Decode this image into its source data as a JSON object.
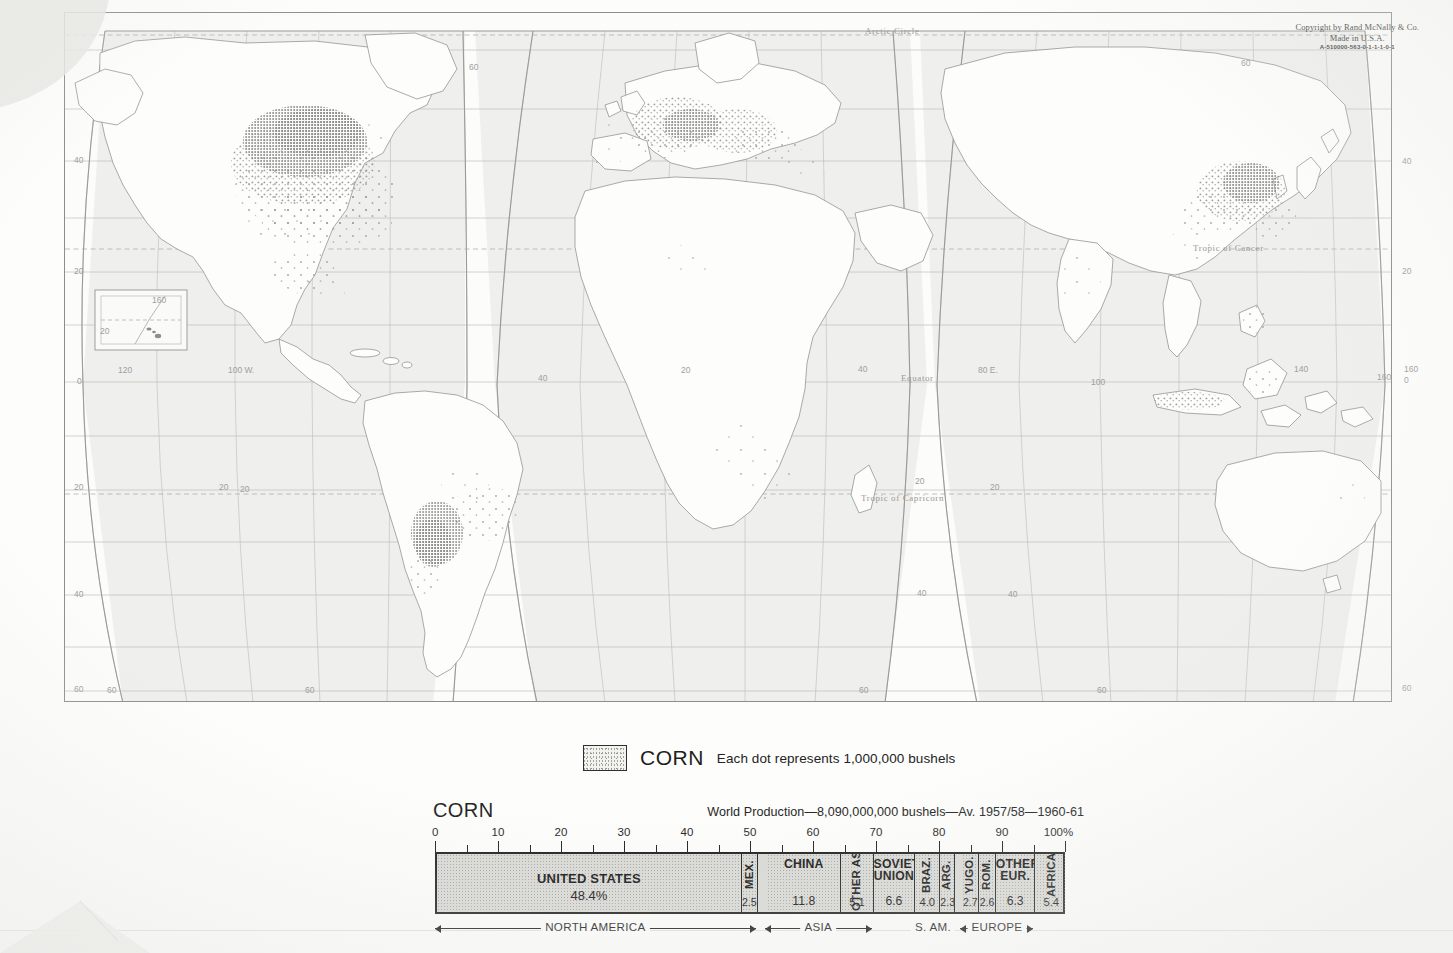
{
  "page": {
    "publisher_copyright": {
      "line1": "Copyright by Rand McNally & Co.",
      "line2": "Made in U.S.A.",
      "code": "A-510000-563-0-1-1-1-0-1"
    }
  },
  "legend": {
    "swatch_name": "corn-dot-pattern-swatch",
    "title": "CORN",
    "note": "Each dot represents 1,000,000 bushels"
  },
  "map": {
    "reference_lines": [
      {
        "label": "Arctic Circle",
        "x": 866,
        "y": 30
      },
      {
        "label": "Tropic of Cancer",
        "x": 1196,
        "y": 241
      },
      {
        "label": "Tropic of Capricorn",
        "x": 862,
        "y": 491
      },
      {
        "label": "Equator",
        "x": 900,
        "y": 369
      }
    ],
    "longitude_labels": [
      {
        "label": "120",
        "x": 124,
        "y": 371
      },
      {
        "label": "100 W.",
        "x": 233,
        "y": 371
      },
      {
        "label": "40",
        "x": 541,
        "y": 378
      },
      {
        "label": "20",
        "x": 684,
        "y": 371
      },
      {
        "label": "40",
        "x": 862,
        "y": 369
      },
      {
        "label": "80 E.",
        "x": 982,
        "y": 371
      },
      {
        "label": "100",
        "x": 1095,
        "y": 382
      },
      {
        "label": "140",
        "x": 1298,
        "y": 369
      },
      {
        "label": "160",
        "x": 1409,
        "y": 369
      }
    ],
    "latitude_labels_left": [
      {
        "label": "40",
        "x": 78,
        "y": 160
      },
      {
        "label": "20",
        "x": 78,
        "y": 271
      },
      {
        "label": "0",
        "x": 80,
        "y": 381
      },
      {
        "label": "20",
        "x": 78,
        "y": 487
      },
      {
        "label": "40",
        "x": 78,
        "y": 594
      },
      {
        "label": "60",
        "x": 78,
        "y": 689
      }
    ],
    "latitude_labels_right": [
      {
        "label": "40",
        "x": 1405,
        "y": 161
      },
      {
        "label": "20",
        "x": 1405,
        "y": 271
      },
      {
        "label": "0",
        "x": 1407,
        "y": 380
      },
      {
        "label": "60",
        "x": 1405,
        "y": 688
      }
    ],
    "other_grid_labels": [
      {
        "label": "60",
        "x": 472,
        "y": 67
      },
      {
        "label": "60",
        "x": 1244,
        "y": 63
      },
      {
        "label": "20",
        "x": 222,
        "y": 487
      },
      {
        "label": "20",
        "x": 243,
        "y": 489
      },
      {
        "label": "20",
        "x": 918,
        "y": 481
      },
      {
        "label": "20",
        "x": 993,
        "y": 487
      },
      {
        "label": "40",
        "x": 920,
        "y": 593
      },
      {
        "label": "40",
        "x": 1011,
        "y": 594
      },
      {
        "label": "60",
        "x": 110,
        "y": 690
      },
      {
        "label": "60",
        "x": 308,
        "y": 690
      },
      {
        "label": "60",
        "x": 862,
        "y": 690
      },
      {
        "label": "60",
        "x": 1100,
        "y": 690
      },
      {
        "label": "160",
        "x": 1381,
        "y": 377
      }
    ],
    "inset": {
      "name": "hawaii-inset",
      "labels": [
        {
          "label": "160",
          "x": 156,
          "y": 300
        },
        {
          "label": "20",
          "x": 103,
          "y": 331
        }
      ]
    }
  },
  "chart_data": {
    "type": "bar",
    "orientation": "stacked-horizontal-100pct",
    "title": "CORN",
    "subtitle": "World Production—8,090,000,000 bushels—Av. 1957/58—1960-61",
    "xlabel": "",
    "ylabel": "",
    "xlim": [
      0,
      100
    ],
    "axis_unit": "%",
    "axis_end_label": "100%",
    "tick_labels": [
      "0",
      "10",
      "20",
      "30",
      "40",
      "50",
      "60",
      "70",
      "80",
      "90",
      "100"
    ],
    "major_tick_step": 10,
    "minor_tick_step": 5,
    "grid": false,
    "legend": "none",
    "categories": [
      "UNITED STATES",
      "MEX.",
      "CHINA",
      "OTHER ASIA",
      "SOVIET UNION",
      "BRAZ.",
      "ARG.",
      "YUGO.",
      "ROM.",
      "OTHER EUR.",
      "AFRICA"
    ],
    "values": [
      48.4,
      2.5,
      11.8,
      5.1,
      6.6,
      4.0,
      2.3,
      2.7,
      2.6,
      6.3,
      5.4
    ],
    "value_labels": [
      "48.4%",
      "2.5",
      "11.8",
      "5.1",
      "6.6",
      "4.0",
      "2.3",
      "2.7",
      "2.6",
      "6.3",
      "5.4"
    ],
    "segments": [
      {
        "name": "UNITED STATES",
        "name_lines": [
          "UNITED STATES"
        ],
        "value": 48.4,
        "value_label": "48.4%",
        "start": 0.0,
        "end": 48.4,
        "orient": "h",
        "size": "big"
      },
      {
        "name": "MEX.",
        "name_lines": [
          "MEX."
        ],
        "value": 2.5,
        "value_label": "2.5",
        "start": 48.4,
        "end": 50.9,
        "orient": "v",
        "size": "narrow"
      },
      {
        "name": "CHINA",
        "name_lines": [
          "CHINA"
        ],
        "value": 11.8,
        "value_label": "11.8",
        "start": 52.4,
        "end": 64.2,
        "orient": "h",
        "size": "normal"
      },
      {
        "name": "OTHER ASIA",
        "name_lines": [
          "OTHER",
          "ASIA"
        ],
        "value": 5.1,
        "value_label": "5.1",
        "start": 64.2,
        "end": 69.3,
        "orient": "v",
        "size": "normal"
      },
      {
        "name": "SOVIET UNION",
        "name_lines": [
          "SOVIET",
          "UNION"
        ],
        "value": 6.6,
        "value_label": "6.6",
        "start": 69.3,
        "end": 75.9,
        "orient": "h",
        "size": "normal"
      },
      {
        "name": "BRAZ.",
        "name_lines": [
          "BRAZ."
        ],
        "value": 4.0,
        "value_label": "4.0",
        "start": 75.9,
        "end": 79.9,
        "orient": "v",
        "size": "normal"
      },
      {
        "name": "ARG.",
        "name_lines": [
          "ARG."
        ],
        "value": 2.3,
        "value_label": "2.3",
        "start": 79.9,
        "end": 82.2,
        "orient": "v",
        "size": "narrow"
      },
      {
        "name": "YUGO.",
        "name_lines": [
          "YUGO."
        ],
        "value": 2.7,
        "value_label": "2.7",
        "start": 83.4,
        "end": 86.1,
        "orient": "v",
        "size": "narrow"
      },
      {
        "name": "ROM.",
        "name_lines": [
          "ROM."
        ],
        "value": 2.6,
        "value_label": "2.6",
        "start": 86.1,
        "end": 88.7,
        "orient": "v",
        "size": "narrow"
      },
      {
        "name": "OTHER EUR.",
        "name_lines": [
          "OTHER",
          "EUR."
        ],
        "value": 6.3,
        "value_label": "6.3",
        "start": 88.7,
        "end": 95.0,
        "orient": "h",
        "size": "normal"
      },
      {
        "name": "AFRICA",
        "name_lines": [
          "AFRICA"
        ],
        "value": 5.4,
        "value_label": "5.4",
        "start": 95.0,
        "end": 100.0,
        "orient": "v",
        "size": "normal"
      }
    ],
    "region_brackets": [
      {
        "label": "NORTH AMERICA",
        "start": 0.0,
        "end": 50.9
      },
      {
        "label": "ASIA",
        "start": 52.4,
        "end": 69.3
      },
      {
        "label": "S. AM.",
        "start": 75.9,
        "end": 82.2
      },
      {
        "label": "EUROPE",
        "start": 83.4,
        "end": 95.0
      }
    ]
  }
}
